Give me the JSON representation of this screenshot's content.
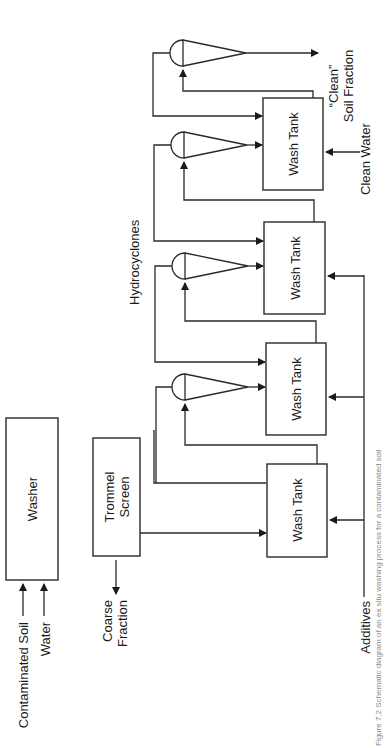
{
  "figure": {
    "caption": "Figure 7.2  Schematic diagram of an ex situ washing process for a contaminated soil",
    "orientation": "rotated 90° counter-clockwise"
  },
  "nodes": {
    "washer": "Washer",
    "trommel_line1": "Trommel",
    "trommel_line2": "Screen",
    "wash_tank_1": "Wash Tank",
    "wash_tank_2": "Wash Tank",
    "wash_tank_3": "Wash Tank",
    "wash_tank_4": "Wash Tank"
  },
  "labels": {
    "contaminated_soil": "Contaminated Soil",
    "water": "Water",
    "coarse_line1": "Coarse",
    "coarse_line2": "Fraction",
    "additives": "Additives",
    "hydrocyclones": "Hydrocyclones",
    "clean_water": "Clean Water",
    "clean_soil_line1": "“Clean”",
    "clean_soil_line2": "Soil Fraction"
  },
  "flows": [
    {
      "from": "Contaminated Soil",
      "to": "Washer"
    },
    {
      "from": "Water",
      "to": "Washer"
    },
    {
      "from": "Washer",
      "to": "Trommel Screen"
    },
    {
      "from": "Trommel Screen",
      "to": "Coarse Fraction"
    },
    {
      "from": "Trommel Screen",
      "to": "Wash Tank 1"
    },
    {
      "from": "Additives",
      "to": "Wash Tank 1, 2, 3"
    },
    {
      "from": "Wash Tank 1",
      "to": "Hydrocyclone 1"
    },
    {
      "from": "Hydrocyclone 1 underflow",
      "to": "Wash Tank 2"
    },
    {
      "from": "Wash Tank 2",
      "to": "Hydrocyclone 2"
    },
    {
      "from": "Hydrocyclone 2 underflow",
      "to": "Wash Tank 3"
    },
    {
      "from": "Wash Tank 3",
      "to": "Hydrocyclone 3"
    },
    {
      "from": "Hydrocyclone 3 underflow",
      "to": "Wash Tank 4"
    },
    {
      "from": "Clean Water",
      "to": "Wash Tank 4"
    },
    {
      "from": "Wash Tank 4",
      "to": "Hydrocyclone 4"
    },
    {
      "from": "Hydrocyclone 4 underflow",
      "to": "“Clean” Soil Fraction"
    },
    {
      "from": "Hydrocyclone overflow (recycle)",
      "to": "previous Wash Tank"
    }
  ]
}
